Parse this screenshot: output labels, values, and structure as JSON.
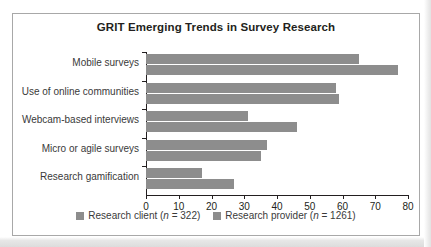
{
  "chart_data": {
    "type": "bar",
    "orientation": "horizontal",
    "title": "GRIT Emerging Trends in Survey Research",
    "xlabel": "",
    "ylabel": "",
    "xlim": [
      0,
      80
    ],
    "xticks": [
      0,
      10,
      20,
      30,
      40,
      50,
      60,
      70,
      80
    ],
    "grid": false,
    "legend_position": "bottom",
    "categories": [
      "Mobile surveys",
      "Use of online communities",
      "Webcam-based interviews",
      "Micro or agile surveys",
      "Research gamification"
    ],
    "series": [
      {
        "name": "Research client (n = 322)",
        "color": "#8d8d8d",
        "values": [
          65,
          58,
          31,
          37,
          17
        ]
      },
      {
        "name": "Research provider (n = 1261)",
        "color": "#8d8d8d",
        "values": [
          77,
          59,
          46,
          35,
          27
        ]
      }
    ]
  },
  "legend": {
    "items": [
      {
        "label_prefix": "Research client (",
        "label_italic": "n",
        "label_suffix": " = 322)"
      },
      {
        "label_prefix": "Research provider (",
        "label_italic": "n",
        "label_suffix": " = 1261)"
      }
    ]
  },
  "axis": {
    "tick_labels": [
      "0",
      "10",
      "20",
      "30",
      "40",
      "50",
      "60",
      "70",
      "80"
    ]
  }
}
